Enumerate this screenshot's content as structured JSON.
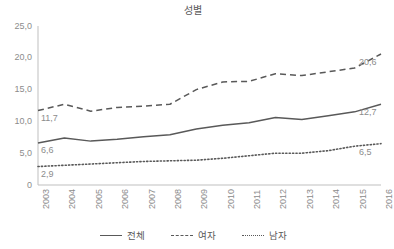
{
  "chart_data": {
    "type": "line",
    "title": "성별",
    "xlabel": "",
    "ylabel": "",
    "ylim": [
      0,
      25
    ],
    "grid": false,
    "legend_position": "bottom",
    "x": [
      "2003",
      "2004",
      "2005",
      "2006",
      "2007",
      "2008",
      "2009",
      "2010",
      "2011",
      "2012",
      "2013",
      "2014",
      "2015",
      "2016"
    ],
    "categories": [
      "2003",
      "2004",
      "2005",
      "2006",
      "2007",
      "2008",
      "2009",
      "2010",
      "2011",
      "2012",
      "2013",
      "2014",
      "2015",
      "2016"
    ],
    "ytick_labels": [
      "0",
      "5,0",
      "10,0",
      "15,0",
      "20,0",
      "25,0"
    ],
    "ytick_values": [
      0,
      5,
      10,
      15,
      20,
      25
    ],
    "series": [
      {
        "name": "전체",
        "style": "solid",
        "color": "#595959",
        "values": [
          6.6,
          7.4,
          6.9,
          7.2,
          7.6,
          7.9,
          8.8,
          9.4,
          9.8,
          10.6,
          10.3,
          10.9,
          11.5,
          12.7
        ],
        "start_label": "6,6",
        "end_label": "12,7"
      },
      {
        "name": "여자",
        "style": "dashed",
        "color": "#595959",
        "values": [
          11.7,
          12.7,
          11.6,
          12.2,
          12.4,
          12.7,
          15.0,
          16.2,
          16.3,
          17.5,
          17.2,
          17.8,
          18.4,
          20.6
        ],
        "start_label": "11,7",
        "end_label": "20,6"
      },
      {
        "name": "남자",
        "style": "dotted",
        "color": "#595959",
        "values": [
          2.9,
          3.1,
          3.3,
          3.5,
          3.7,
          3.8,
          3.9,
          4.2,
          4.6,
          5.0,
          5.0,
          5.4,
          6.1,
          6.5
        ],
        "start_label": "2,9",
        "end_label": "6,5"
      }
    ]
  },
  "legend": {
    "items": [
      {
        "label": "전체",
        "style": "solid"
      },
      {
        "label": "여자",
        "style": "dashed"
      },
      {
        "label": "남자",
        "style": "dotted"
      }
    ]
  },
  "colors": {
    "line": "#595959",
    "axis": "#bfbfbf",
    "tick_text": "#8c8c8c",
    "title_text": "#595959",
    "background": "#ffffff"
  }
}
